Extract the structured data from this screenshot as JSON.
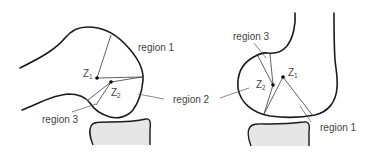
{
  "figure": {
    "left_panel": {
      "points": {
        "z1": {
          "label": "Z",
          "sub": "1"
        },
        "z2": {
          "label": "Z",
          "sub": "2"
        }
      },
      "labels": {
        "region1": "region 1",
        "region2": "region 2",
        "region3": "region 3"
      }
    },
    "right_panel": {
      "points": {
        "z1": {
          "label": "Z",
          "sub": "1"
        },
        "z2": {
          "label": "Z",
          "sub": "2"
        }
      },
      "labels": {
        "region1": "region 1",
        "region3": "region 3"
      }
    },
    "colors": {
      "outline": "#1a1a1a",
      "tibia_fill": "#e6e6e6",
      "text": "#444444"
    }
  }
}
